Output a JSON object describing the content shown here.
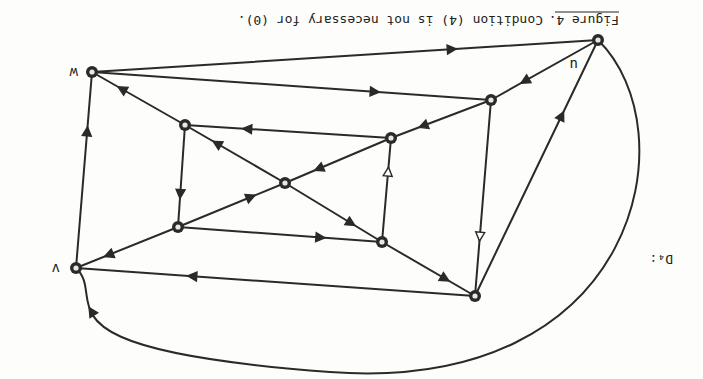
{
  "figure": {
    "orientation": "rotated 180 degrees (scanned upside down)",
    "graph_label": "D₄:",
    "caption": {
      "label": "Figure 4.",
      "text": "Condition (4) is not necessary for (0)."
    }
  },
  "colors": {
    "ink": "#2a2a2a",
    "paper": "#fdfdfb"
  },
  "nodes": [
    {
      "id": "w",
      "label": "w",
      "x": 92,
      "y": 72
    },
    {
      "id": "u",
      "label": "u",
      "x": 598,
      "y": 40
    },
    {
      "id": "v",
      "label": "v",
      "x": 76,
      "y": 268
    },
    {
      "id": "a",
      "label": "",
      "x": 185,
      "y": 125
    },
    {
      "id": "b",
      "label": "",
      "x": 391,
      "y": 138
    },
    {
      "id": "c",
      "label": "",
      "x": 285,
      "y": 183
    },
    {
      "id": "d",
      "label": "",
      "x": 178,
      "y": 227
    },
    {
      "id": "e",
      "label": "",
      "x": 382,
      "y": 242
    },
    {
      "id": "f",
      "label": "",
      "x": 491,
      "y": 100
    },
    {
      "id": "g",
      "label": "",
      "x": 475,
      "y": 296
    }
  ],
  "edges": [
    {
      "from": "w",
      "to": "u",
      "arrow": "filled"
    },
    {
      "from": "w",
      "to": "f",
      "arrow": "filled"
    },
    {
      "from": "a",
      "to": "w",
      "arrow": "filled"
    },
    {
      "from": "v",
      "to": "w",
      "arrow": "filled"
    },
    {
      "from": "u",
      "to": "f",
      "arrow": "filled"
    },
    {
      "from": "g",
      "to": "u",
      "arrow": "filled"
    },
    {
      "from": "u",
      "to": "v",
      "arrow": "filled",
      "curved": true
    },
    {
      "from": "f",
      "to": "b",
      "arrow": "filled"
    },
    {
      "from": "f",
      "to": "g",
      "arrow": "open"
    },
    {
      "from": "b",
      "to": "a",
      "arrow": "filled"
    },
    {
      "from": "b",
      "to": "c",
      "arrow": "filled"
    },
    {
      "from": "c",
      "to": "a",
      "arrow": "filled"
    },
    {
      "from": "a",
      "to": "d",
      "arrow": "filled"
    },
    {
      "from": "d",
      "to": "c",
      "arrow": "filled"
    },
    {
      "from": "d",
      "to": "v",
      "arrow": "filled"
    },
    {
      "from": "d",
      "to": "e",
      "arrow": "filled"
    },
    {
      "from": "c",
      "to": "e",
      "arrow": "filled"
    },
    {
      "from": "e",
      "to": "b",
      "arrow": "open"
    },
    {
      "from": "e",
      "to": "g",
      "arrow": "filled"
    },
    {
      "from": "g",
      "to": "v",
      "arrow": "filled"
    }
  ]
}
